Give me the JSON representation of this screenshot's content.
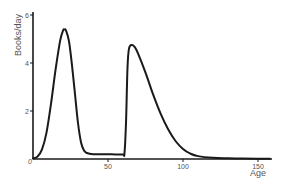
{
  "chart_data": {
    "type": "line",
    "title": "",
    "xlabel": "Age",
    "ylabel": "Books/day",
    "xlim": [
      0,
      160
    ],
    "ylim": [
      0,
      6
    ],
    "grid": false,
    "legend": null,
    "x_ticks": [
      {
        "value": 0,
        "label": "0"
      },
      {
        "value": 50,
        "label": "50"
      },
      {
        "value": 100,
        "label": "100"
      },
      {
        "value": 150,
        "label": "150"
      }
    ],
    "y_ticks": [
      {
        "value": 0,
        "label": ""
      },
      {
        "value": 2,
        "label": "2"
      },
      {
        "value": 4,
        "label": "4"
      },
      {
        "value": 6,
        "label": "6"
      }
    ],
    "series": [
      {
        "name": "Books/day",
        "color": "#1a1a1a",
        "x": [
          0,
          3,
          6,
          9,
          12,
          15,
          18,
          20,
          21,
          22,
          24,
          26,
          28,
          30,
          32,
          34,
          36,
          40,
          45,
          50,
          55,
          60,
          61,
          62,
          63,
          64,
          66,
          68,
          70,
          75,
          80,
          85,
          90,
          95,
          100,
          105,
          110,
          120,
          130,
          140,
          150,
          158
        ],
        "y": [
          0.02,
          0.1,
          0.4,
          1.1,
          2.3,
          3.7,
          4.9,
          5.35,
          5.4,
          5.35,
          4.9,
          3.9,
          2.7,
          1.5,
          0.7,
          0.35,
          0.25,
          0.2,
          0.2,
          0.2,
          0.19,
          0.19,
          0.25,
          1.5,
          3.8,
          4.6,
          4.75,
          4.65,
          4.4,
          3.6,
          2.7,
          1.9,
          1.25,
          0.75,
          0.42,
          0.22,
          0.12,
          0.05,
          0.03,
          0.02,
          0.01,
          0.01
        ]
      }
    ]
  },
  "axes": {
    "x_label": "Age",
    "y_label": "Books/day",
    "origin_label": "0"
  }
}
